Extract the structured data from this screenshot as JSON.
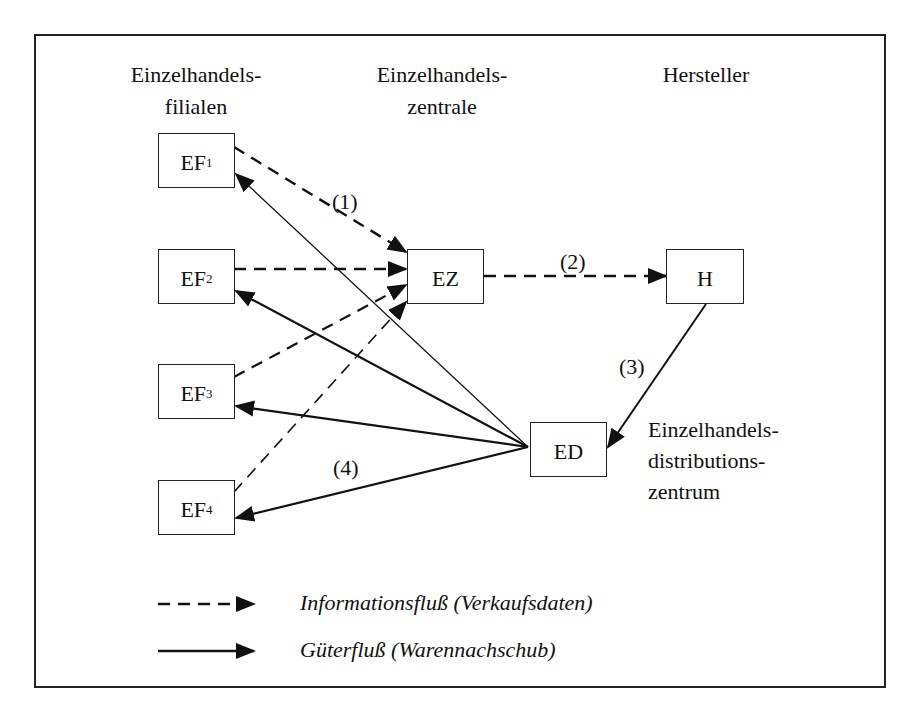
{
  "headers": {
    "retail_stores": [
      "Einzelhandels-",
      "filialen"
    ],
    "retail_hq": [
      "Einzelhandels-",
      "zentrale"
    ],
    "manufacturer": [
      "Hersteller"
    ]
  },
  "nodes": {
    "EF1": {
      "label": "EF",
      "sub": "1"
    },
    "EF2": {
      "label": "EF",
      "sub": "2"
    },
    "EF3": {
      "label": "EF",
      "sub": "3"
    },
    "EF4": {
      "label": "EF",
      "sub": "4"
    },
    "EZ": {
      "label": "EZ"
    },
    "H": {
      "label": "H"
    },
    "ED": {
      "label": "ED"
    }
  },
  "distribution_center_label": [
    "Einzelhandels-",
    "distributions-",
    "zentrum"
  ],
  "flow_labels": {
    "step1": "(1)",
    "step2": "(2)",
    "step3": "(3)",
    "step4": "(4)"
  },
  "edges": [
    {
      "from": "EF1",
      "to": "EZ",
      "type": "information"
    },
    {
      "from": "EF2",
      "to": "EZ",
      "type": "information"
    },
    {
      "from": "EF3",
      "to": "EZ",
      "type": "information"
    },
    {
      "from": "EF4",
      "to": "EZ",
      "type": "information"
    },
    {
      "from": "EZ",
      "to": "H",
      "type": "information"
    },
    {
      "from": "H",
      "to": "ED",
      "type": "goods"
    },
    {
      "from": "ED",
      "to": "EF1",
      "type": "goods"
    },
    {
      "from": "ED",
      "to": "EF2",
      "type": "goods"
    },
    {
      "from": "ED",
      "to": "EF3",
      "type": "goods"
    },
    {
      "from": "ED",
      "to": "EF4",
      "type": "goods"
    }
  ],
  "legend": {
    "information": "Informationsfluß (Verkaufsdaten)",
    "goods": "Güterfluß (Warennachschub)"
  },
  "colors": {
    "line": "#111111",
    "background": "#ffffff"
  }
}
